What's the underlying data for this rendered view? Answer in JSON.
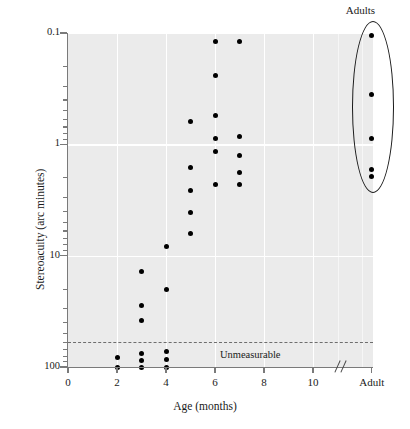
{
  "chart_data": {
    "type": "scatter",
    "title": "",
    "xlabel": "Age (months)",
    "ylabel": "Stereoacuity (arc minutes)",
    "y_scale": "log",
    "y_inverted": true,
    "ylim": [
      0.1,
      100
    ],
    "y_ticks": [
      0.1,
      1,
      10,
      100
    ],
    "y_tick_labels": [
      "0.1",
      "1",
      "10",
      "100"
    ],
    "x_ticks": [
      0,
      2,
      4,
      6,
      8,
      10
    ],
    "x_tick_labels": [
      "0",
      "2",
      "4",
      "6",
      "8",
      "10"
    ],
    "x_extra_tick_label": "Adult",
    "x_axis_break": true,
    "grid": true,
    "legend": null,
    "annotations": [
      {
        "text": "Unmeasurable",
        "x": 6.2,
        "y": 80
      },
      {
        "text": "Adults",
        "x": 12.4,
        "y": 0.085
      }
    ],
    "threshold_line": {
      "label": "Unmeasurable",
      "y": 60,
      "style": "dashed"
    },
    "series": [
      {
        "name": "Infants",
        "points": [
          {
            "x": 2,
            "y": 82
          },
          {
            "x": 2,
            "y": 100
          },
          {
            "x": 3,
            "y": 14
          },
          {
            "x": 3,
            "y": 28
          },
          {
            "x": 3,
            "y": 38
          },
          {
            "x": 3,
            "y": 76
          },
          {
            "x": 3,
            "y": 88
          },
          {
            "x": 3,
            "y": 100
          },
          {
            "x": 4,
            "y": 8.2
          },
          {
            "x": 4,
            "y": 20
          },
          {
            "x": 4,
            "y": 72
          },
          {
            "x": 4,
            "y": 86
          },
          {
            "x": 4,
            "y": 100
          },
          {
            "x": 5,
            "y": 0.62
          },
          {
            "x": 5,
            "y": 1.6
          },
          {
            "x": 5,
            "y": 2.6
          },
          {
            "x": 5,
            "y": 4.1
          },
          {
            "x": 5,
            "y": 6.3
          },
          {
            "x": 6,
            "y": 0.12
          },
          {
            "x": 6,
            "y": 0.24
          },
          {
            "x": 6,
            "y": 0.55
          },
          {
            "x": 6,
            "y": 0.88
          },
          {
            "x": 6,
            "y": 1.15
          },
          {
            "x": 6,
            "y": 2.3
          },
          {
            "x": 7,
            "y": 0.12
          },
          {
            "x": 7,
            "y": 0.85
          },
          {
            "x": 7,
            "y": 1.25
          },
          {
            "x": 7,
            "y": 1.8
          },
          {
            "x": 7,
            "y": 2.3
          }
        ]
      },
      {
        "name": "Adults",
        "points": [
          {
            "x": 12.4,
            "y": 0.105
          },
          {
            "x": 12.4,
            "y": 0.36
          },
          {
            "x": 12.4,
            "y": 0.88
          },
          {
            "x": 12.4,
            "y": 1.7
          },
          {
            "x": 12.4,
            "y": 1.95
          }
        ]
      }
    ]
  },
  "labels": {
    "xlabel": "Age (months)",
    "ylabel": "Stereoacuity (arc minutes)",
    "unmeasurable": "Unmeasurable",
    "adults": "Adults"
  },
  "colors": {
    "panel_background": "#ebebeb",
    "gridline": "#ffffff",
    "point": "#000000",
    "axis": "#7a7a7a",
    "dashed_line": "#6e6e6e",
    "text": "#1a1a1a",
    "page_background": "#ffffff"
  }
}
